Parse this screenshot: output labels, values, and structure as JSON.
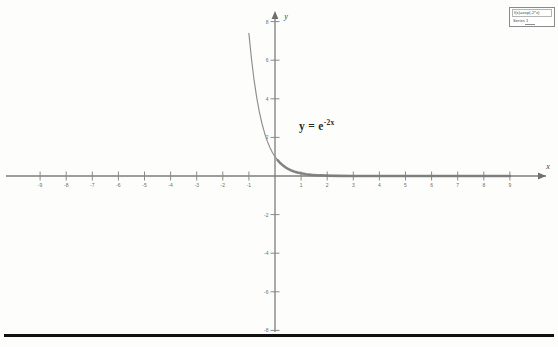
{
  "legend": {
    "title": "f(x)=exp(-2*x)",
    "entries": [
      {
        "label": "Series 1",
        "color": "#8d8d8d"
      }
    ]
  },
  "annotation": {
    "base": "y = e",
    "exponent": "-2x"
  },
  "axes": {
    "x_label": "x",
    "y_label": "y"
  },
  "chart_data": {
    "type": "line",
    "title": "f(x)=exp(-2*x)",
    "xlabel": "x",
    "ylabel": "y",
    "xlim": [
      -9.8,
      9.8
    ],
    "ylim": [
      -9.2,
      9.0
    ],
    "grid": false,
    "legend_position": "top-right",
    "annotations": [
      {
        "text": "y = e^-2x",
        "x": 0.9,
        "y": 2.4
      }
    ],
    "x_ticks": [
      -9,
      -8,
      -7,
      -6,
      -5,
      -4,
      -3,
      -2,
      -1,
      1,
      2,
      3,
      4,
      5,
      6,
      7,
      8,
      9
    ],
    "y_ticks": [
      -8,
      -6,
      -4,
      -2,
      2,
      4,
      6,
      8
    ],
    "x_tick_labels": [
      "-9",
      "-8",
      "-7",
      "-6",
      "-5",
      "-4",
      "-3",
      "-2",
      "-1",
      "1",
      "2",
      "3",
      "4",
      "5",
      "6",
      "7",
      "8",
      "9"
    ],
    "y_tick_labels": [
      "-8",
      "-6",
      "-4",
      "-2",
      "2",
      "4",
      "6",
      "8"
    ],
    "series": [
      {
        "name": "Series 1",
        "color": "#8d8d8d",
        "formula": "y = exp(-2x)",
        "x": [
          -1.15,
          -1.1,
          -1.0,
          -0.9,
          -0.8,
          -0.7,
          -0.6,
          -0.5,
          -0.4,
          -0.3,
          -0.2,
          -0.1,
          0.0,
          0.1,
          0.2,
          0.3,
          0.4,
          0.5,
          0.6,
          0.7,
          0.8,
          0.9,
          1.0,
          1.2,
          1.4,
          1.6,
          1.8,
          2.0,
          2.5,
          3.0,
          3.5,
          4.0,
          5.0,
          6.0,
          7.0,
          8.0,
          9.0
        ],
        "y": [
          9.97,
          9.03,
          7.39,
          6.05,
          4.95,
          4.06,
          3.32,
          2.72,
          2.23,
          1.82,
          1.49,
          1.22,
          1.0,
          0.82,
          0.67,
          0.55,
          0.45,
          0.37,
          0.3,
          0.25,
          0.2,
          0.17,
          0.14,
          0.09,
          0.06,
          0.04,
          0.03,
          0.02,
          0.007,
          0.002,
          0.001,
          0.0003,
          5e-05,
          6e-06,
          8e-07,
          1e-07,
          2e-08
        ]
      }
    ]
  }
}
